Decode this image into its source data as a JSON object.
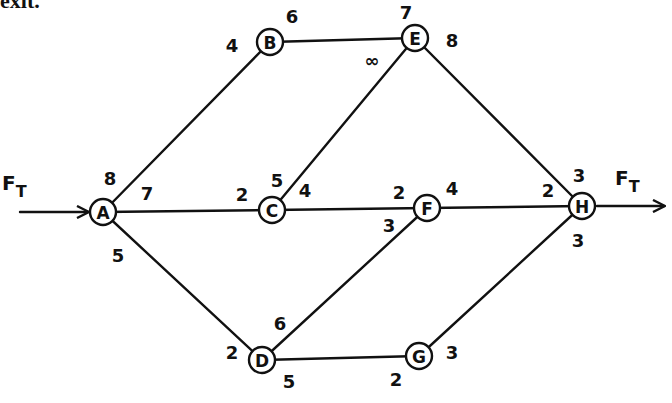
{
  "header": {
    "text": "exit."
  },
  "diagram": {
    "source_label": {
      "main": "F",
      "sub": "T"
    },
    "sink_label": {
      "main": "F",
      "sub": "T"
    },
    "nodes": [
      {
        "id": "A",
        "x": 103,
        "y": 212
      },
      {
        "id": "B",
        "x": 270,
        "y": 42
      },
      {
        "id": "C",
        "x": 272,
        "y": 210
      },
      {
        "id": "D",
        "x": 262,
        "y": 360
      },
      {
        "id": "E",
        "x": 415,
        "y": 38
      },
      {
        "id": "F",
        "x": 427,
        "y": 208
      },
      {
        "id": "G",
        "x": 419,
        "y": 356
      },
      {
        "id": "H",
        "x": 582,
        "y": 206
      }
    ],
    "edges": [
      {
        "from": "A",
        "to": "B",
        "cap_from": "8",
        "cap_to": "4"
      },
      {
        "from": "A",
        "to": "C",
        "cap_from": "7",
        "cap_to": "2"
      },
      {
        "from": "A",
        "to": "D",
        "cap_from": "5",
        "cap_to": "2"
      },
      {
        "from": "B",
        "to": "E",
        "cap_from": "6",
        "cap_to": "7"
      },
      {
        "from": "C",
        "to": "E",
        "cap_from": "5",
        "cap_to": "∞"
      },
      {
        "from": "C",
        "to": "F",
        "cap_from": "4",
        "cap_to": "2"
      },
      {
        "from": "D",
        "to": "F",
        "cap_from": "6",
        "cap_to": "3"
      },
      {
        "from": "D",
        "to": "G",
        "cap_from": "5",
        "cap_to": "2"
      },
      {
        "from": "E",
        "to": "H",
        "cap_from": "8",
        "cap_to": "3"
      },
      {
        "from": "F",
        "to": "H",
        "cap_from": "4",
        "cap_to": "2"
      },
      {
        "from": "G",
        "to": "H",
        "cap_from": "3",
        "cap_to": "3"
      }
    ],
    "capacity_labels": [
      {
        "text": "8",
        "x": 110,
        "y": 178,
        "edge": "A-B",
        "at": "A"
      },
      {
        "text": "7",
        "x": 147,
        "y": 193,
        "edge": "A-C",
        "at": "A"
      },
      {
        "text": "5",
        "x": 118,
        "y": 255,
        "edge": "A-D",
        "at": "A"
      },
      {
        "text": "4",
        "x": 232,
        "y": 45,
        "edge": "A-B",
        "at": "B"
      },
      {
        "text": "6",
        "x": 292,
        "y": 16,
        "edge": "B-E",
        "at": "B"
      },
      {
        "text": "7",
        "x": 406,
        "y": 12,
        "edge": "B-E",
        "at": "E"
      },
      {
        "text": "8",
        "x": 452,
        "y": 40,
        "edge": "E-H",
        "at": "E"
      },
      {
        "text": "∞",
        "x": 372,
        "y": 60,
        "edge": "C-E",
        "at": "E"
      },
      {
        "text": "2",
        "x": 242,
        "y": 194,
        "edge": "A-C",
        "at": "C"
      },
      {
        "text": "5",
        "x": 277,
        "y": 180,
        "edge": "C-E",
        "at": "C"
      },
      {
        "text": "4",
        "x": 305,
        "y": 190,
        "edge": "C-F",
        "at": "C"
      },
      {
        "text": "2",
        "x": 399,
        "y": 192,
        "edge": "C-F",
        "at": "F"
      },
      {
        "text": "4",
        "x": 452,
        "y": 188,
        "edge": "F-H",
        "at": "F"
      },
      {
        "text": "3",
        "x": 389,
        "y": 225,
        "edge": "D-F",
        "at": "F"
      },
      {
        "text": "3",
        "x": 579,
        "y": 175,
        "edge": "E-H",
        "at": "H"
      },
      {
        "text": "2",
        "x": 548,
        "y": 190,
        "edge": "F-H",
        "at": "H"
      },
      {
        "text": "3",
        "x": 578,
        "y": 240,
        "edge": "G-H",
        "at": "H"
      },
      {
        "text": "6",
        "x": 280,
        "y": 323,
        "edge": "D-F",
        "at": "D"
      },
      {
        "text": "2",
        "x": 232,
        "y": 352,
        "edge": "A-D",
        "at": "D"
      },
      {
        "text": "5",
        "x": 289,
        "y": 381,
        "edge": "D-G",
        "at": "D"
      },
      {
        "text": "2",
        "x": 396,
        "y": 379,
        "edge": "D-G",
        "at": "G"
      },
      {
        "text": "3",
        "x": 452,
        "y": 352,
        "edge": "G-H",
        "at": "G"
      }
    ]
  }
}
